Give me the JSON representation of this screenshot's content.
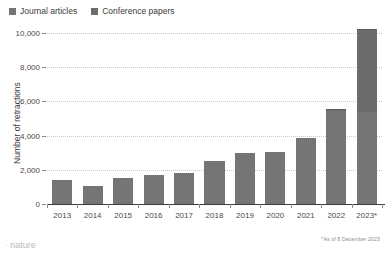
{
  "legend": {
    "items": [
      {
        "label": "Journal articles",
        "color": "#757575",
        "swatch_icon": "square-swatch-icon"
      },
      {
        "label": "Conference papers",
        "color": "#6c6c6c",
        "swatch_icon": "square-swatch-icon"
      }
    ]
  },
  "footnote": "*As of 8 December 2023",
  "brand": {
    "name": "nature",
    "mark": "·"
  },
  "chart_data": {
    "type": "bar",
    "title": "",
    "subtitle": "",
    "xlabel": "",
    "ylabel": "Number of retractions",
    "stacked": true,
    "grid": true,
    "legend_position": "top-left",
    "ylim": [
      0,
      10000
    ],
    "yticks": [
      0,
      2000,
      4000,
      6000,
      8000,
      10000
    ],
    "ytick_labels": [
      "0",
      "2,000",
      "4,000",
      "6,000",
      "8,000",
      "10,000"
    ],
    "categories": [
      "2013",
      "2014",
      "2015",
      "2016",
      "2017",
      "2018",
      "2019",
      "2020",
      "2021",
      "2022",
      "2023*"
    ],
    "series": [
      {
        "name": "Journal articles",
        "color": "#757575",
        "values": [
          1400,
          1050,
          1500,
          1680,
          1800,
          2500,
          3000,
          3050,
          3850,
          5450,
          5400
        ]
      },
      {
        "name": "Conference papers",
        "color": "#6c6c6c",
        "values": [
          0,
          0,
          0,
          0,
          0,
          0,
          0,
          0,
          0,
          50,
          4800
        ]
      }
    ],
    "totals": [
      1400,
      1050,
      1500,
      1680,
      1800,
      2500,
      3000,
      3050,
      3850,
      5500,
      10200
    ]
  }
}
